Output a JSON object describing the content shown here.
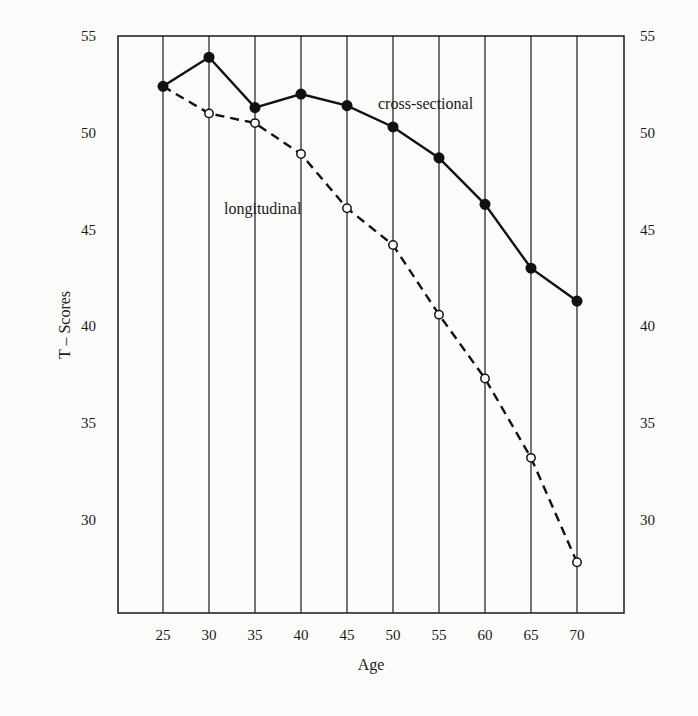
{
  "chart_data": {
    "type": "line",
    "title": "",
    "xlabel": "Age",
    "ylabel": "T – Scores",
    "x": [
      25,
      30,
      35,
      40,
      45,
      50,
      55,
      60,
      65,
      70
    ],
    "xlim": [
      20,
      75
    ],
    "ylim": [
      25,
      55
    ],
    "yticks": [
      30,
      35,
      40,
      45,
      50,
      55
    ],
    "xticks": [
      25,
      30,
      35,
      40,
      45,
      50,
      55,
      60,
      65,
      70
    ],
    "grid": "vertical lines at each x tick",
    "right_axis_ticks": [
      30,
      35,
      40,
      45,
      50,
      55
    ],
    "series": [
      {
        "name": "cross-sectional",
        "style": "solid, filled circles",
        "values": [
          52.4,
          53.9,
          51.3,
          52.0,
          51.4,
          50.3,
          48.7,
          46.3,
          43.0,
          41.3
        ]
      },
      {
        "name": "longitudinal",
        "style": "dashed, open circles",
        "values": [
          52.4,
          51.0,
          50.5,
          48.9,
          46.1,
          44.2,
          40.6,
          37.3,
          33.2,
          27.8
        ]
      }
    ],
    "annotations": [
      {
        "text": "cross-sectional",
        "near": "age 50-60, above solid line"
      },
      {
        "text": "longitudinal",
        "near": "age 35-45, below dashed line"
      }
    ]
  },
  "labels": {
    "xlabel": "Age",
    "ylabel": "T – Scores",
    "cross": "cross-sectional",
    "long": "longitudinal"
  }
}
